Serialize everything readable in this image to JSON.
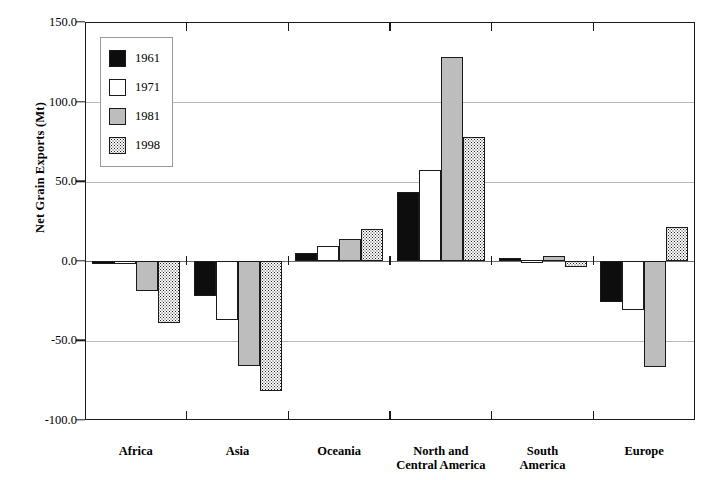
{
  "chart_data": {
    "type": "bar",
    "title": "",
    "subtitle": "",
    "xlabel": "",
    "ylabel": "Net Grain Exports (Mt)",
    "ylim": [
      -100.0,
      150.0
    ],
    "ytick_labels": [
      "150.0",
      "100.0",
      "50.0",
      "0.0",
      "-50.0",
      "-100.0"
    ],
    "ytick_values": [
      150.0,
      100.0,
      50.0,
      0.0,
      -50.0,
      -100.0
    ],
    "grid": true,
    "legend_position": "top-left-inside",
    "categories": [
      "Africa",
      "Asia",
      "Oceania",
      "North and\nCentral America",
      "South\nAmerica",
      "Europe"
    ],
    "series": [
      {
        "name": "1961",
        "color": "#0d0d0d",
        "pattern": "solid-black",
        "values": [
          -1.0,
          -22.0,
          5.0,
          43.0,
          2.0,
          -26.0
        ]
      },
      {
        "name": "1971",
        "color": "#ffffff",
        "pattern": "solid-white",
        "values": [
          -1.5,
          -37.0,
          9.0,
          57.0,
          0.3,
          -31.0
        ]
      },
      {
        "name": "1981",
        "color": "#bdbdbd",
        "pattern": "solid-gray",
        "values": [
          -19.0,
          -66.0,
          13.5,
          128.0,
          3.0,
          -67.0
        ]
      },
      {
        "name": "1998",
        "color": "#fdfdfd",
        "pattern": "stipple-dots",
        "values": [
          -39.0,
          -82.0,
          20.0,
          78.0,
          -4.0,
          21.0
        ]
      }
    ]
  },
  "legend": {
    "entries": [
      {
        "label": "1961"
      },
      {
        "label": "1971"
      },
      {
        "label": "1981"
      },
      {
        "label": "1998"
      }
    ]
  },
  "axis": {
    "y_title": "Net Grain Exports (Mt)"
  }
}
